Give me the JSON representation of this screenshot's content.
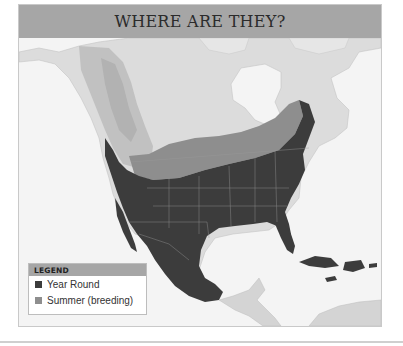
{
  "header": {
    "title": "WHERE ARE THEY?"
  },
  "map": {
    "region": "North America",
    "style": "grayscale shaded relief",
    "colors": {
      "ocean": "#f4f4f4",
      "land": "#dcdcdc",
      "relief": "#bcbcbc",
      "year_round": "#3c3c3c",
      "summer": "#8e8e8e",
      "header": "#a6a6a6"
    }
  },
  "legend": {
    "title": "LEGEND",
    "items": [
      {
        "label": "Year Round",
        "color": "#3c3c3c"
      },
      {
        "label": "Summer (breeding)",
        "color": "#8e8e8e"
      }
    ]
  }
}
